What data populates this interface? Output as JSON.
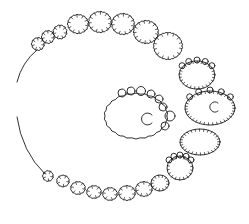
{
  "diagram": {
    "colors": {
      "background": "#ffffff",
      "ink": "#1a1a1a"
    },
    "left_arcs": [
      {
        "name": "upper-arc",
        "d": "M37,50 Q22,62 17,82"
      },
      {
        "name": "lower-arc",
        "d": "M17,117 Q22,152 45,174"
      }
    ],
    "top_chain": [
      {
        "cx": 38,
        "cy": 44,
        "rx": 6,
        "ry": 6
      },
      {
        "cx": 48,
        "cy": 37,
        "rx": 6,
        "ry": 6
      },
      {
        "cx": 60,
        "cy": 32,
        "rx": 6.5,
        "ry": 6.5
      },
      {
        "cx": 78,
        "cy": 24,
        "rx": 10,
        "ry": 9
      },
      {
        "cx": 100,
        "cy": 22,
        "rx": 11,
        "ry": 10
      },
      {
        "cx": 123,
        "cy": 24,
        "rx": 11,
        "ry": 10
      },
      {
        "cx": 146,
        "cy": 32,
        "rx": 12,
        "ry": 11
      },
      {
        "cx": 168,
        "cy": 46,
        "rx": 14,
        "ry": 13
      }
    ],
    "right_column": [
      {
        "cx": 197,
        "cy": 75,
        "rx": 18,
        "ry": 14,
        "bumps": true
      },
      {
        "cx": 210,
        "cy": 108,
        "rx": 25,
        "ry": 17,
        "bumps": true,
        "eye": {
          "cx": 215,
          "cy": 107,
          "r": 5
        }
      },
      {
        "cx": 200,
        "cy": 142,
        "rx": 20,
        "ry": 13,
        "bumps": false
      },
      {
        "cx": 180,
        "cy": 168,
        "rx": 13,
        "ry": 12,
        "bumps": true
      },
      {
        "cx": 160,
        "cy": 183,
        "rx": 9,
        "ry": 8,
        "bumps": false
      }
    ],
    "bottom_chain": [
      {
        "cx": 48,
        "cy": 176,
        "rx": 5,
        "ry": 5
      },
      {
        "cx": 63,
        "cy": 181,
        "rx": 6,
        "ry": 5.5
      },
      {
        "cx": 78,
        "cy": 188,
        "rx": 7,
        "ry": 6
      },
      {
        "cx": 94,
        "cy": 192,
        "rx": 7,
        "ry": 6
      },
      {
        "cx": 110,
        "cy": 194,
        "rx": 7,
        "ry": 6
      },
      {
        "cx": 127,
        "cy": 193,
        "rx": 8,
        "ry": 7
      },
      {
        "cx": 144,
        "cy": 189,
        "rx": 8,
        "ry": 7
      }
    ],
    "central_body": {
      "cx": 136,
      "cy": 116,
      "rx": 31,
      "ry": 22,
      "eye": {
        "cx": 148,
        "cy": 119,
        "r": 6
      },
      "top_bumps": [
        {
          "cx": 122,
          "cy": 93,
          "r": 4
        },
        {
          "cx": 131,
          "cy": 91,
          "r": 4
        },
        {
          "cx": 141,
          "cy": 91,
          "r": 4.5
        },
        {
          "cx": 151,
          "cy": 94,
          "r": 4
        },
        {
          "cx": 159,
          "cy": 99,
          "r": 4
        },
        {
          "cx": 163,
          "cy": 107,
          "r": 4
        }
      ],
      "side_bumps": [
        {
          "cx": 170,
          "cy": 116,
          "r": 5
        },
        {
          "cx": 165,
          "cy": 126,
          "r": 4
        }
      ]
    }
  }
}
